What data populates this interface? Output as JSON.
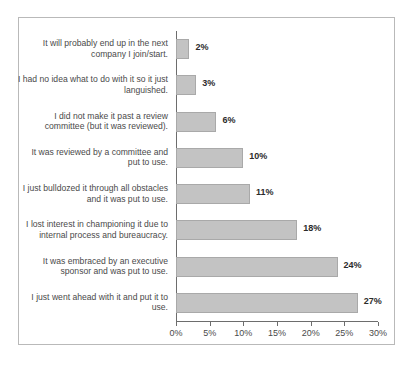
{
  "chart_data": {
    "type": "bar",
    "orientation": "horizontal",
    "title": "",
    "xlabel": "",
    "ylabel": "",
    "xlim": [
      0,
      30
    ],
    "grid": false,
    "legend": false,
    "value_suffix": "%",
    "xticks": [
      {
        "value": 0,
        "label": "0%"
      },
      {
        "value": 5,
        "label": "5%"
      },
      {
        "value": 10,
        "label": "10%"
      },
      {
        "value": 15,
        "label": "15%"
      },
      {
        "value": 20,
        "label": "20%"
      },
      {
        "value": 25,
        "label": "25%"
      },
      {
        "value": 30,
        "label": "30%"
      }
    ],
    "categories": [
      "It will probably end up in the next company I join/start.",
      "I had no idea what to do with it so it just languished.",
      "I did not make it past a review committee (but it was reviewed).",
      "It was reviewed by a committee and put to use.",
      "I just bulldozed it through all obstacles and it was put to use.",
      "I lost interest in championing it due to internal process and bureaucracy.",
      "It was embraced by an executive sponsor and was put to use.",
      "I just went ahead with it and put it to use."
    ],
    "values": [
      2,
      3,
      6,
      10,
      11,
      18,
      24,
      27
    ],
    "value_labels": [
      "2%",
      "3%",
      "6%",
      "10%",
      "11%",
      "18%",
      "24%",
      "27%"
    ],
    "colors": {
      "bar_fill": "#c3c3c3",
      "bar_border": "#a9a9a9",
      "axis": "#6d6d6d",
      "frame": "#b9b9b9",
      "label_text": "#4a4a4a",
      "value_text": "#2b2b2b",
      "background": "#ffffff"
    }
  }
}
